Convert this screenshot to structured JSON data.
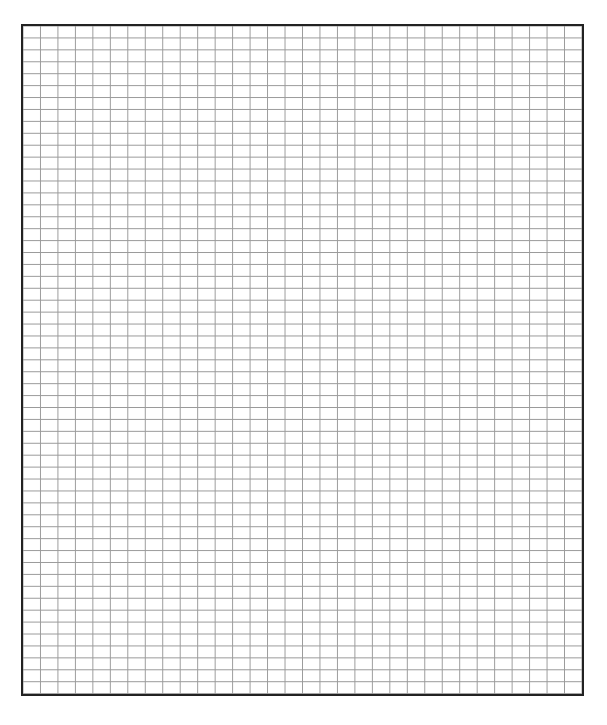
{
  "page": {
    "type": "graph-paper",
    "background_color": "#ffffff"
  },
  "grid": {
    "columns": 32,
    "rows": 56,
    "line_color": "#9a9a9a",
    "border_color": "#222222",
    "border_width_px": 2
  }
}
